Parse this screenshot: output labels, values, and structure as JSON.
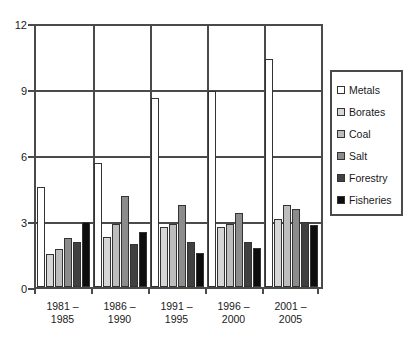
{
  "chart_data": {
    "type": "bar",
    "title": "",
    "subtitle": "",
    "xlabel": "",
    "ylabel": "",
    "categories": [
      "1981 –\n1985",
      "1986 –\n1990",
      "1991 –\n1995",
      "1996 –\n2000",
      "2001 –\n2005"
    ],
    "series": [
      {
        "name": "Metals",
        "color": "#ffffff",
        "values": [
          4.6,
          5.7,
          8.7,
          9.0,
          10.5
        ]
      },
      {
        "name": "Borates",
        "color": "#d6d6d6",
        "values": [
          1.5,
          2.3,
          2.75,
          2.75,
          3.15
        ]
      },
      {
        "name": "Coal",
        "color": "#bdbdbd",
        "values": [
          1.75,
          2.9,
          2.9,
          2.9,
          3.75
        ]
      },
      {
        "name": "Salt",
        "color": "#8c8c8c",
        "values": [
          2.25,
          4.2,
          3.75,
          3.4,
          3.6
        ]
      },
      {
        "name": "Forestry",
        "color": "#404040",
        "values": [
          2.05,
          2.0,
          2.05,
          2.05,
          3.0
        ]
      },
      {
        "name": "Fisheries",
        "color": "#0d0d0d",
        "values": [
          3.0,
          2.55,
          1.55,
          1.8,
          2.85
        ]
      }
    ],
    "ylim": [
      0,
      12
    ],
    "yticks": [
      0,
      3,
      6,
      9,
      12
    ],
    "ytick_labels": [
      "0",
      "3",
      "6",
      "9",
      "12"
    ],
    "grid": true,
    "grid_axis": "y",
    "legend_position": "right-outside",
    "legend_entries": [
      "Metals",
      "Borates",
      "Coal",
      "Salt",
      "Forestry",
      "Fisheries"
    ]
  },
  "axis": {
    "y_tick_0": "0",
    "y_tick_3": "3",
    "y_tick_6": "6",
    "y_tick_9": "9",
    "y_tick_12": "12"
  },
  "colors": {
    "axis": "#4a4a4a",
    "bar_outline": "#333333",
    "plot_background": "#ffffff",
    "text": "#1a1a1a"
  }
}
